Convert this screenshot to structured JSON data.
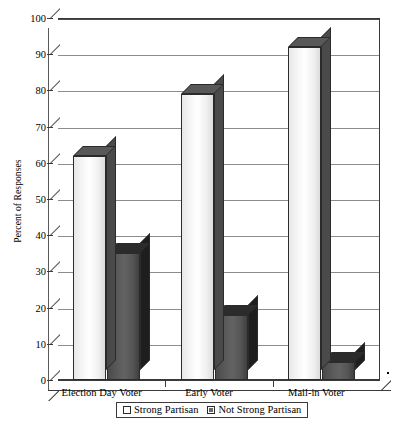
{
  "chart_data": {
    "type": "bar",
    "title": "",
    "subtitle": "",
    "xlabel": "",
    "ylabel": "Percent of Responses",
    "categories": [
      "Election Day Voter",
      "Early Voter",
      "Mail-in Voter"
    ],
    "series": [
      {
        "name": "Strong Partisan",
        "values": [
          62,
          79,
          92
        ],
        "color": "#f2f2f2"
      },
      {
        "name": "Not Strong Partisan",
        "values": [
          35,
          18,
          5
        ],
        "color": "#5e5e5e"
      }
    ],
    "ylim": [
      0,
      100
    ],
    "yticks": [
      0,
      10,
      20,
      30,
      40,
      50,
      60,
      70,
      80,
      90,
      100
    ],
    "ytick_labels": [
      "0",
      "10",
      "20",
      "30",
      "40",
      "50",
      "60",
      "70",
      "80",
      "90",
      "100"
    ],
    "grid": true,
    "grid_axis": "y",
    "legend_position": "bottom",
    "style": "3d-column",
    "plot_background": "#ffffff",
    "grid_color": "#8c8c8c",
    "axis_color": "#3a3a3a"
  },
  "legend": {
    "items": [
      {
        "label": "Strong Partisan",
        "swatch": "light-square"
      },
      {
        "label": "Not Strong Partisan",
        "swatch": "dark-square"
      }
    ]
  }
}
